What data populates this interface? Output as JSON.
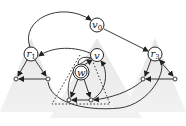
{
  "diagram": {
    "nodes": {
      "v0": {
        "label": "v",
        "sub": "0"
      },
      "r1": {
        "label": "r",
        "sub": "1"
      },
      "r3": {
        "label": "r",
        "sub": "3"
      },
      "v": {
        "label": "v",
        "sub": ""
      },
      "w": {
        "label": "w",
        "sub": ""
      }
    },
    "colors": {
      "triangle_fill": "#e4e4e4",
      "edge": "#222222",
      "dotted": "#333333"
    }
  }
}
